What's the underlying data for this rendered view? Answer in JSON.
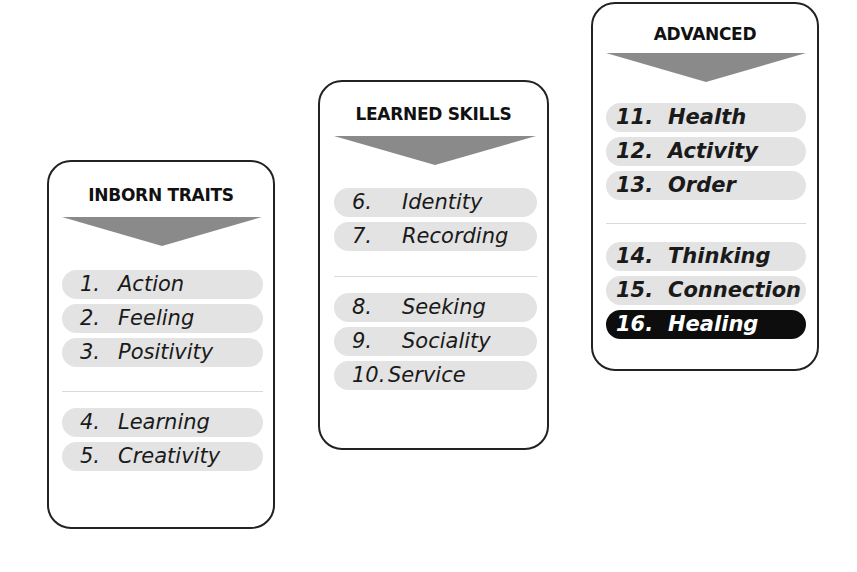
{
  "diagram": {
    "colors": {
      "card_border": "#222222",
      "arrow": "#8a8a8a",
      "pill": "#e3e3e3",
      "highlight_pill": "#0d0d0d",
      "highlight_text": "#ffffff",
      "divider": "#d9d9d9"
    },
    "columns": [
      {
        "title": "INBORN TRAITS",
        "groups": [
          [
            {
              "number": "1.",
              "label": "Action"
            },
            {
              "number": "2.",
              "label": "Feeling"
            },
            {
              "number": "3.",
              "label": "Positivity"
            }
          ],
          [
            {
              "number": "4.",
              "label": "Learning"
            },
            {
              "number": "5.",
              "label": "Creativity"
            }
          ]
        ]
      },
      {
        "title": "LEARNED SKILLS",
        "groups": [
          [
            {
              "number": "6.",
              "label": "Identity"
            },
            {
              "number": "7.",
              "label": "Recording"
            }
          ],
          [
            {
              "number": "8.",
              "label": "Seeking"
            },
            {
              "number": "9.",
              "label": "Sociality"
            },
            {
              "number": "10.",
              "label": "Service"
            }
          ]
        ]
      },
      {
        "title": "ADVANCED",
        "groups": [
          [
            {
              "number": "11.",
              "label": "Health"
            },
            {
              "number": "12.",
              "label": "Activity"
            },
            {
              "number": "13.",
              "label": "Order"
            }
          ],
          [
            {
              "number": "14.",
              "label": "Thinking"
            },
            {
              "number": "15.",
              "label": "Connection"
            },
            {
              "number": "16.",
              "label": "Healing",
              "highlighted": true
            }
          ]
        ]
      }
    ]
  }
}
